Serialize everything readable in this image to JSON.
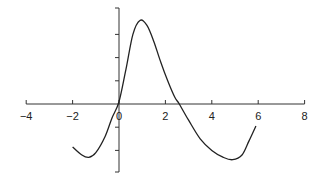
{
  "chart_data": {
    "type": "line",
    "title": "",
    "xlabel": "",
    "ylabel": "",
    "xlim": [
      -4,
      8
    ],
    "ylim": [
      -4.5,
      4.1
    ],
    "grid": false,
    "legend": null,
    "x_ticks": [
      -4,
      -2,
      0,
      2,
      4,
      6,
      8
    ],
    "x_tick_labels": [
      "−4",
      "−2",
      "0",
      "2",
      "4",
      "6",
      "8"
    ],
    "y_ticks": [
      -3,
      -2,
      -1,
      0,
      1,
      2,
      3
    ],
    "y_tick_labels": [],
    "series": [
      {
        "name": "f(x)",
        "x": [
          -2.0,
          -1.6,
          -1.3,
          -1.0,
          -0.6,
          -0.3,
          0.0,
          0.3,
          0.6,
          0.9,
          1.2,
          1.5,
          1.8,
          2.1,
          2.4,
          2.6,
          3.0,
          3.5,
          4.0,
          4.5,
          4.9,
          5.3,
          5.6,
          5.9
        ],
        "y": [
          -1.85,
          -2.2,
          -2.3,
          -2.1,
          -1.4,
          -0.6,
          0.1,
          1.5,
          3.0,
          3.6,
          3.4,
          2.7,
          1.8,
          1.0,
          0.3,
          0.0,
          -0.7,
          -1.5,
          -2.0,
          -2.3,
          -2.4,
          -2.2,
          -1.6,
          -0.95
        ]
      }
    ]
  }
}
